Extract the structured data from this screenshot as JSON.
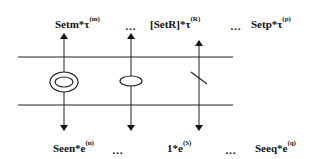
{
  "diagram": {
    "top_labels": [
      {
        "base": "Setm*τ",
        "sup": "(m)"
      },
      {
        "base": "[SetR]*τ",
        "sup": "(R)"
      },
      {
        "base": "Setp*τ",
        "sup": "(p)"
      }
    ],
    "bottom_labels": [
      {
        "base": "Seen*e",
        "sup": "(n)"
      },
      {
        "base": "1*e",
        "sup": "(S)"
      },
      {
        "base": "Seeq*e",
        "sup": "(q)"
      }
    ],
    "ellipsis": "…",
    "elements": [
      {
        "type": "double-ellipse",
        "x": 64
      },
      {
        "type": "single-ellipse",
        "x": 131
      },
      {
        "type": "slash",
        "x": 199
      }
    ],
    "line_color": "#222222"
  }
}
